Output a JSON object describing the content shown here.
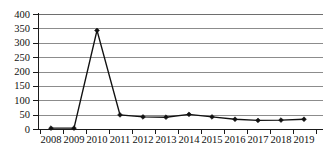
{
  "chart_data": {
    "type": "line",
    "title": "",
    "subtitle": "",
    "xlabel": "",
    "ylabel": "",
    "categories": [
      "2008",
      "2009",
      "2010",
      "2011",
      "2012",
      "2013",
      "2014",
      "2015",
      "2016",
      "2017",
      "2018",
      "2019"
    ],
    "values": [
      3,
      3,
      343,
      49,
      42,
      41,
      51,
      42,
      34,
      30,
      31,
      34
    ],
    "series": [
      {
        "name": "",
        "values": [
          3,
          3,
          343,
          49,
          42,
          41,
          51,
          42,
          34,
          30,
          31,
          34
        ]
      }
    ],
    "ylim": [
      0,
      400
    ],
    "ytick_values": [
      0,
      50,
      100,
      150,
      200,
      250,
      300,
      350,
      400
    ],
    "ytick_labels": [
      "0",
      "50",
      "100",
      "150",
      "200",
      "250",
      "300",
      "350",
      "400"
    ],
    "grid": true,
    "grid_axis": "y",
    "legend": false,
    "legend_position": "none",
    "marker": "diamond",
    "line_color": "#111111",
    "grid_color": "#8c8c8c",
    "axis_color": "#1a1a1a",
    "background_color": "#ffffff",
    "annotations": []
  }
}
